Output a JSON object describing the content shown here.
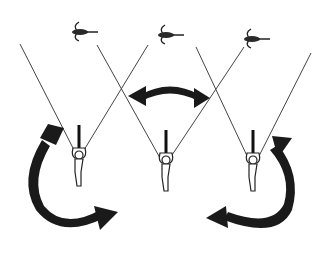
{
  "diagram": {
    "title": "",
    "colors": {
      "ink": "#1a1a1a",
      "line": "#444444",
      "background": "#ffffff"
    },
    "kites": [
      {
        "id": "kite-left",
        "x": 82,
        "y": 30
      },
      {
        "id": "kite-center",
        "x": 170,
        "y": 33
      },
      {
        "id": "kite-right",
        "x": 256,
        "y": 37
      }
    ],
    "pilots": [
      {
        "id": "pilot-left",
        "x": 78,
        "y": 155
      },
      {
        "id": "pilot-center",
        "x": 165,
        "y": 160
      },
      {
        "id": "pilot-right",
        "x": 252,
        "y": 160
      }
    ],
    "arrows": [
      {
        "id": "arrow-left-rotate",
        "direction": "clockwise-loop"
      },
      {
        "id": "arrow-center-swing",
        "direction": "double-headed-horizontal"
      },
      {
        "id": "arrow-right-rotate",
        "direction": "counterclockwise-loop"
      }
    ]
  }
}
